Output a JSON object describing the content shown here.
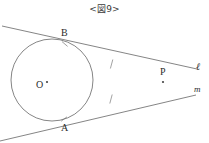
{
  "figure": {
    "title": "<図9>",
    "caption_left_bracket": "<",
    "caption_right_bracket": ">",
    "stroke_color": "#555555",
    "label_color": "#2b2b2b",
    "background_color": "#ffffff"
  },
  "labels": {
    "point_B": "B",
    "point_A": "A",
    "point_P": "P",
    "center_O": "O",
    "line_ell": "ℓ",
    "line_m": "m"
  },
  "geometry": {
    "circle": {
      "cx": 52,
      "cy": 80,
      "r": 41
    },
    "center_dot": {
      "cx": 47,
      "cy": 82,
      "r": 1.1
    },
    "tangent_point_B": {
      "x": 65,
      "y": 44
    },
    "tangent_point_A": {
      "x": 64,
      "y": 119
    },
    "intersection_P": {
      "x": 163,
      "y": 82
    },
    "line_ell_path": {
      "x1": 2,
      "y1": 26,
      "x2": 197,
      "y2": 69
    },
    "line_m_path": {
      "x1": 0,
      "y1": 141,
      "x2": 196,
      "y2": 95
    },
    "tick_upper": {
      "x": 112,
      "y": 64
    },
    "tick_lower": {
      "x": 111,
      "y": 99
    }
  }
}
